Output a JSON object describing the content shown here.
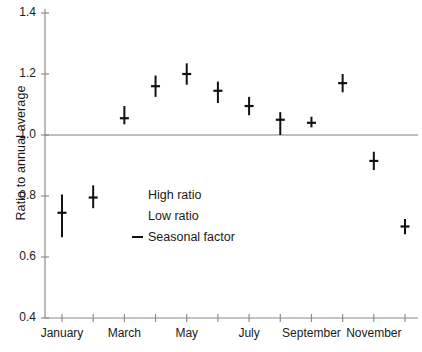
{
  "chart_data": {
    "type": "scatter",
    "title": "",
    "xlabel": "",
    "ylabel": "Ratio to annual average",
    "ylim": [
      0.4,
      1.4
    ],
    "ytick_labels": [
      "1.4",
      "1.2",
      "1.0",
      "0.8",
      "0.6",
      "0.4"
    ],
    "ytick_values": [
      1.4,
      1.2,
      1.0,
      0.8,
      0.6,
      0.4
    ],
    "categories": [
      "January",
      "February",
      "March",
      "April",
      "May",
      "June",
      "July",
      "August",
      "September",
      "October",
      "November",
      "December"
    ],
    "xtick_labels_shown": [
      "January",
      "",
      "March",
      "",
      "May",
      "",
      "July",
      "",
      "September",
      "",
      "November",
      ""
    ],
    "grid": false,
    "legend_position": "center-left-inside",
    "reference_line": {
      "value": 1.0,
      "label": "annual average",
      "color": "#808080"
    },
    "series": [
      {
        "name": "High ratio",
        "values": [
          0.805,
          0.835,
          1.095,
          1.195,
          1.235,
          1.175,
          1.125,
          1.075,
          1.06,
          1.2,
          0.945,
          0.725
        ]
      },
      {
        "name": "Low ratio",
        "values": [
          0.665,
          0.76,
          1.035,
          1.125,
          1.165,
          1.105,
          1.065,
          1.0,
          1.025,
          1.14,
          0.885,
          0.675
        ]
      },
      {
        "name": "Seasonal factor",
        "values": [
          0.745,
          0.795,
          1.055,
          1.16,
          1.2,
          1.145,
          1.095,
          1.05,
          1.04,
          1.17,
          0.915,
          0.7
        ]
      }
    ],
    "legend": [
      {
        "label": "High ratio",
        "marker": "none"
      },
      {
        "label": "Low ratio",
        "marker": "none"
      },
      {
        "label": "Seasonal factor",
        "marker": "dash"
      }
    ],
    "style": {
      "marker_color": "#111111",
      "axis_color": "#8c8c8c",
      "bar_width_px": 2,
      "tick_width_px": 9
    }
  }
}
